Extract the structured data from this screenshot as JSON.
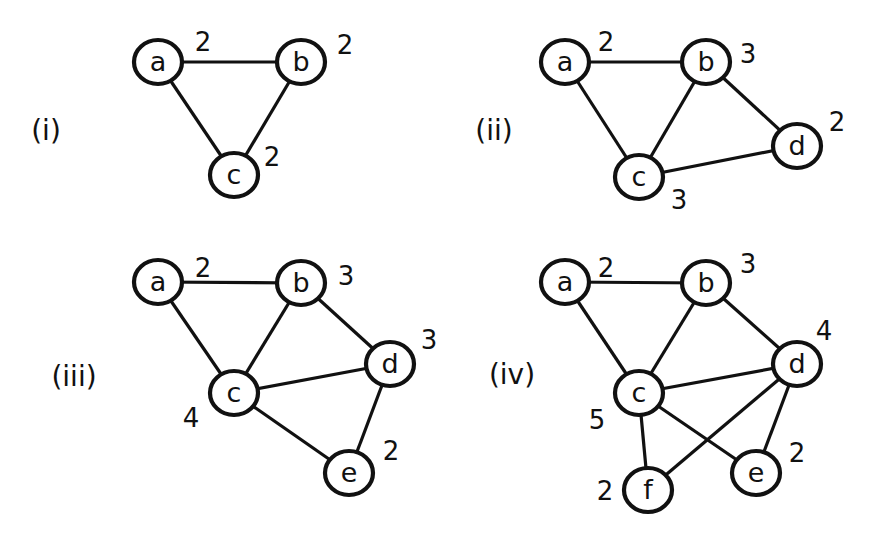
{
  "figure": {
    "panels": [
      {
        "id": "i",
        "label": "(i)",
        "label_pos": [
          46,
          130
        ],
        "nodes": [
          {
            "id": "a",
            "x": 158,
            "y": 62,
            "degree": "2",
            "deg_pos": [
              203,
              42
            ]
          },
          {
            "id": "b",
            "x": 301,
            "y": 62,
            "degree": "2",
            "deg_pos": [
              345,
              45
            ]
          },
          {
            "id": "c",
            "x": 234,
            "y": 175,
            "degree": "2",
            "deg_pos": [
              272,
              157
            ]
          }
        ],
        "edges": [
          [
            "a",
            "b"
          ],
          [
            "a",
            "c"
          ],
          [
            "b",
            "c"
          ]
        ]
      },
      {
        "id": "ii",
        "label": "(ii)",
        "label_pos": [
          494,
          130
        ],
        "nodes": [
          {
            "id": "a",
            "x": 565,
            "y": 62,
            "degree": "2",
            "deg_pos": [
              606,
              42
            ]
          },
          {
            "id": "b",
            "x": 706,
            "y": 62,
            "degree": "3",
            "deg_pos": [
              748,
              54
            ]
          },
          {
            "id": "c",
            "x": 639,
            "y": 177,
            "degree": "3",
            "deg_pos": [
              679,
              200
            ]
          },
          {
            "id": "d",
            "x": 797,
            "y": 146,
            "degree": "2",
            "deg_pos": [
              837,
              122
            ]
          }
        ],
        "edges": [
          [
            "a",
            "b"
          ],
          [
            "a",
            "c"
          ],
          [
            "b",
            "c"
          ],
          [
            "b",
            "d"
          ],
          [
            "c",
            "d"
          ]
        ]
      },
      {
        "id": "iii",
        "label": "(iii)",
        "label_pos": [
          74,
          376
        ],
        "nodes": [
          {
            "id": "a",
            "x": 158,
            "y": 282,
            "degree": "2",
            "deg_pos": [
              203,
              268
            ]
          },
          {
            "id": "b",
            "x": 301,
            "y": 283,
            "degree": "3",
            "deg_pos": [
              346,
              276
            ]
          },
          {
            "id": "c",
            "x": 234,
            "y": 393,
            "degree": "4",
            "deg_pos": [
              191,
              418
            ]
          },
          {
            "id": "d",
            "x": 390,
            "y": 364,
            "degree": "3",
            "deg_pos": [
              429,
              340
            ]
          },
          {
            "id": "e",
            "x": 349,
            "y": 473,
            "degree": "2",
            "deg_pos": [
              391,
              451
            ]
          }
        ],
        "edges": [
          [
            "a",
            "b"
          ],
          [
            "a",
            "c"
          ],
          [
            "b",
            "c"
          ],
          [
            "b",
            "d"
          ],
          [
            "c",
            "d"
          ],
          [
            "c",
            "e"
          ],
          [
            "d",
            "e"
          ]
        ]
      },
      {
        "id": "iv",
        "label": "(iv)",
        "label_pos": [
          512,
          374
        ],
        "nodes": [
          {
            "id": "a",
            "x": 565,
            "y": 282,
            "degree": "2",
            "deg_pos": [
              606,
              268
            ]
          },
          {
            "id": "b",
            "x": 706,
            "y": 283,
            "degree": "3",
            "deg_pos": [
              748,
              264
            ]
          },
          {
            "id": "c",
            "x": 639,
            "y": 393,
            "degree": "5",
            "deg_pos": [
              597,
              420
            ]
          },
          {
            "id": "d",
            "x": 797,
            "y": 364,
            "degree": "4",
            "deg_pos": [
              824,
              331
            ]
          },
          {
            "id": "e",
            "x": 756,
            "y": 473,
            "degree": "2",
            "deg_pos": [
              797,
              453
            ]
          },
          {
            "id": "f",
            "x": 648,
            "y": 490,
            "degree": "2",
            "deg_pos": [
              605,
              491
            ]
          }
        ],
        "edges": [
          [
            "a",
            "b"
          ],
          [
            "a",
            "c"
          ],
          [
            "b",
            "c"
          ],
          [
            "b",
            "d"
          ],
          [
            "c",
            "d"
          ],
          [
            "c",
            "e"
          ],
          [
            "c",
            "f"
          ],
          [
            "d",
            "e"
          ],
          [
            "d",
            "f"
          ]
        ]
      }
    ]
  }
}
